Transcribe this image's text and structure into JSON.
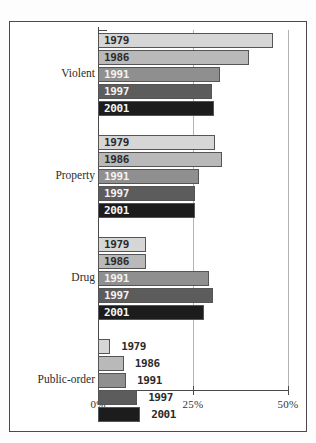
{
  "chart_data": {
    "type": "bar",
    "orientation": "horizontal",
    "title": "",
    "subtitle": "",
    "xlabel": "",
    "ylabel": "",
    "xlim": [
      0,
      50
    ],
    "xunit": "%",
    "xticks": [
      0,
      25,
      50
    ],
    "xticklabels": [
      "0%",
      "25%",
      "50%"
    ],
    "grid": "vertical-at-25-and-50",
    "legend": "inline-bar-labels",
    "categories": [
      "Violent",
      "Property",
      "Drug",
      "Public-order"
    ],
    "series": [
      {
        "name": "1979",
        "color": "#d6d6d6",
        "values": [
          46.0,
          30.8,
          12.6,
          3.2
        ]
      },
      {
        "name": "1986",
        "color": "#b9b9b9",
        "values": [
          39.7,
          32.6,
          12.6,
          6.8
        ]
      },
      {
        "name": "1991",
        "color": "#8f8f8f",
        "values": [
          32.1,
          26.6,
          29.2,
          7.4
        ]
      },
      {
        "name": "1997",
        "color": "#5c5c5c",
        "values": [
          30.0,
          25.5,
          30.3,
          10.3
        ]
      },
      {
        "name": "2001",
        "color": "#1c1c1c",
        "values": [
          30.5,
          25.5,
          27.9,
          11.1
        ]
      }
    ]
  },
  "groups": [
    {
      "label": "Violent",
      "bars": [
        {
          "year": "1979",
          "value": 46.0,
          "color": "#d6d6d6",
          "label_color": "#2b2b2b",
          "label_position": "inside"
        },
        {
          "year": "1986",
          "value": 39.7,
          "color": "#b9b9b9",
          "label_color": "#2b2b2b",
          "label_position": "inside"
        },
        {
          "year": "1991",
          "value": 32.1,
          "color": "#8f8f8f",
          "label_color": "#f2f2f2",
          "label_position": "inside"
        },
        {
          "year": "1997",
          "value": 30.0,
          "color": "#5c5c5c",
          "label_color": "#f2f2f2",
          "label_position": "inside"
        },
        {
          "year": "2001",
          "value": 30.5,
          "color": "#1c1c1c",
          "label_color": "#f5f5f5",
          "label_position": "inside"
        }
      ]
    },
    {
      "label": "Property",
      "bars": [
        {
          "year": "1979",
          "value": 30.8,
          "color": "#d6d6d6",
          "label_color": "#2b2b2b",
          "label_position": "inside"
        },
        {
          "year": "1986",
          "value": 32.6,
          "color": "#b9b9b9",
          "label_color": "#2b2b2b",
          "label_position": "inside"
        },
        {
          "year": "1991",
          "value": 26.6,
          "color": "#8f8f8f",
          "label_color": "#f2f2f2",
          "label_position": "inside"
        },
        {
          "year": "1997",
          "value": 25.5,
          "color": "#5c5c5c",
          "label_color": "#f2f2f2",
          "label_position": "inside"
        },
        {
          "year": "2001",
          "value": 25.5,
          "color": "#1c1c1c",
          "label_color": "#f5f5f5",
          "label_position": "inside"
        }
      ]
    },
    {
      "label": "Drug",
      "bars": [
        {
          "year": "1979",
          "value": 12.6,
          "color": "#d6d6d6",
          "label_color": "#2b2b2b",
          "label_position": "inside"
        },
        {
          "year": "1986",
          "value": 12.6,
          "color": "#b9b9b9",
          "label_color": "#2b2b2b",
          "label_position": "inside"
        },
        {
          "year": "1991",
          "value": 29.2,
          "color": "#8f8f8f",
          "label_color": "#f2f2f2",
          "label_position": "inside"
        },
        {
          "year": "1997",
          "value": 30.3,
          "color": "#5c5c5c",
          "label_color": "#f2f2f2",
          "label_position": "inside"
        },
        {
          "year": "2001",
          "value": 27.9,
          "color": "#1c1c1c",
          "label_color": "#f5f5f5",
          "label_position": "inside"
        }
      ]
    },
    {
      "label": "Public-order",
      "bars": [
        {
          "year": "1979",
          "value": 3.2,
          "color": "#d6d6d6",
          "label_color": "#2b2b2b",
          "label_position": "outside"
        },
        {
          "year": "1986",
          "value": 6.8,
          "color": "#b9b9b9",
          "label_color": "#2b2b2b",
          "label_position": "outside"
        },
        {
          "year": "1991",
          "value": 7.4,
          "color": "#8f8f8f",
          "label_color": "#2b2b2b",
          "label_position": "outside"
        },
        {
          "year": "1997",
          "value": 10.3,
          "color": "#5c5c5c",
          "label_color": "#2b2b2b",
          "label_position": "outside"
        },
        {
          "year": "2001",
          "value": 11.1,
          "color": "#1c1c1c",
          "label_color": "#2b2b2b",
          "label_position": "outside"
        }
      ]
    }
  ],
  "axis": {
    "ticks": [
      {
        "label": "0%",
        "value": 0
      },
      {
        "label": "25%",
        "value": 25
      },
      {
        "label": "50%",
        "value": 50
      }
    ]
  },
  "style": {
    "bar_border": "#555555",
    "axis_color": "#4a4a4a",
    "grid_color": "#b4b4b4",
    "frame_color": "#4a4a4a",
    "background": "#ffffff"
  }
}
